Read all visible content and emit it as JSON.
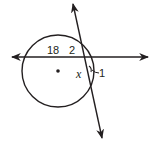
{
  "diagram": {
    "type": "geometry",
    "colors": {
      "stroke": "#231f20",
      "background": "#ffffff"
    },
    "labels": {
      "segment_18": "18",
      "segment_2": "2",
      "variable_x": "x",
      "angle_1": "1"
    },
    "circle": {
      "cx": 58,
      "cy": 71,
      "r": 36,
      "center_dot": true
    },
    "horizontal_line": {
      "x1": 12,
      "y1": 57,
      "x2": 148,
      "y2": 57,
      "arrows": "both"
    },
    "slanted_line": {
      "x1": 73,
      "y1": 4,
      "x2": 102,
      "y2": 138,
      "arrows": "both"
    }
  }
}
